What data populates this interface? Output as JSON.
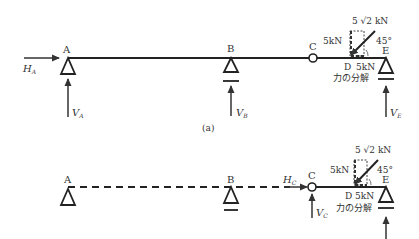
{
  "diagram_a": {
    "caption": "(a)",
    "nodes": {
      "A": "A",
      "B": "B",
      "C": "C",
      "D": "D",
      "E": "E"
    },
    "reactions": {
      "HA": {
        "main": "H",
        "sub": "A"
      },
      "VA": {
        "main": "V",
        "sub": "A"
      },
      "VB": {
        "main": "V",
        "sub": "B"
      },
      "VE": {
        "main": "V",
        "sub": "E"
      }
    },
    "load": {
      "resultant": "5 √2 kN",
      "vertical": "5kN",
      "horizontal": "5kN",
      "angle": "45°",
      "decomposition_label": "力の分解"
    }
  },
  "diagram_b": {
    "nodes": {
      "A": "A",
      "B": "B",
      "C": "C",
      "D": "D",
      "E": "E"
    },
    "reactions": {
      "HC": {
        "main": "H",
        "sub": "C"
      },
      "VC": {
        "main": "V",
        "sub": "C"
      }
    },
    "load": {
      "resultant": "5 √2 kN",
      "vertical": "5kN",
      "horizontal": "5kN",
      "angle": "45°",
      "decomposition_label": "力の分解"
    }
  }
}
